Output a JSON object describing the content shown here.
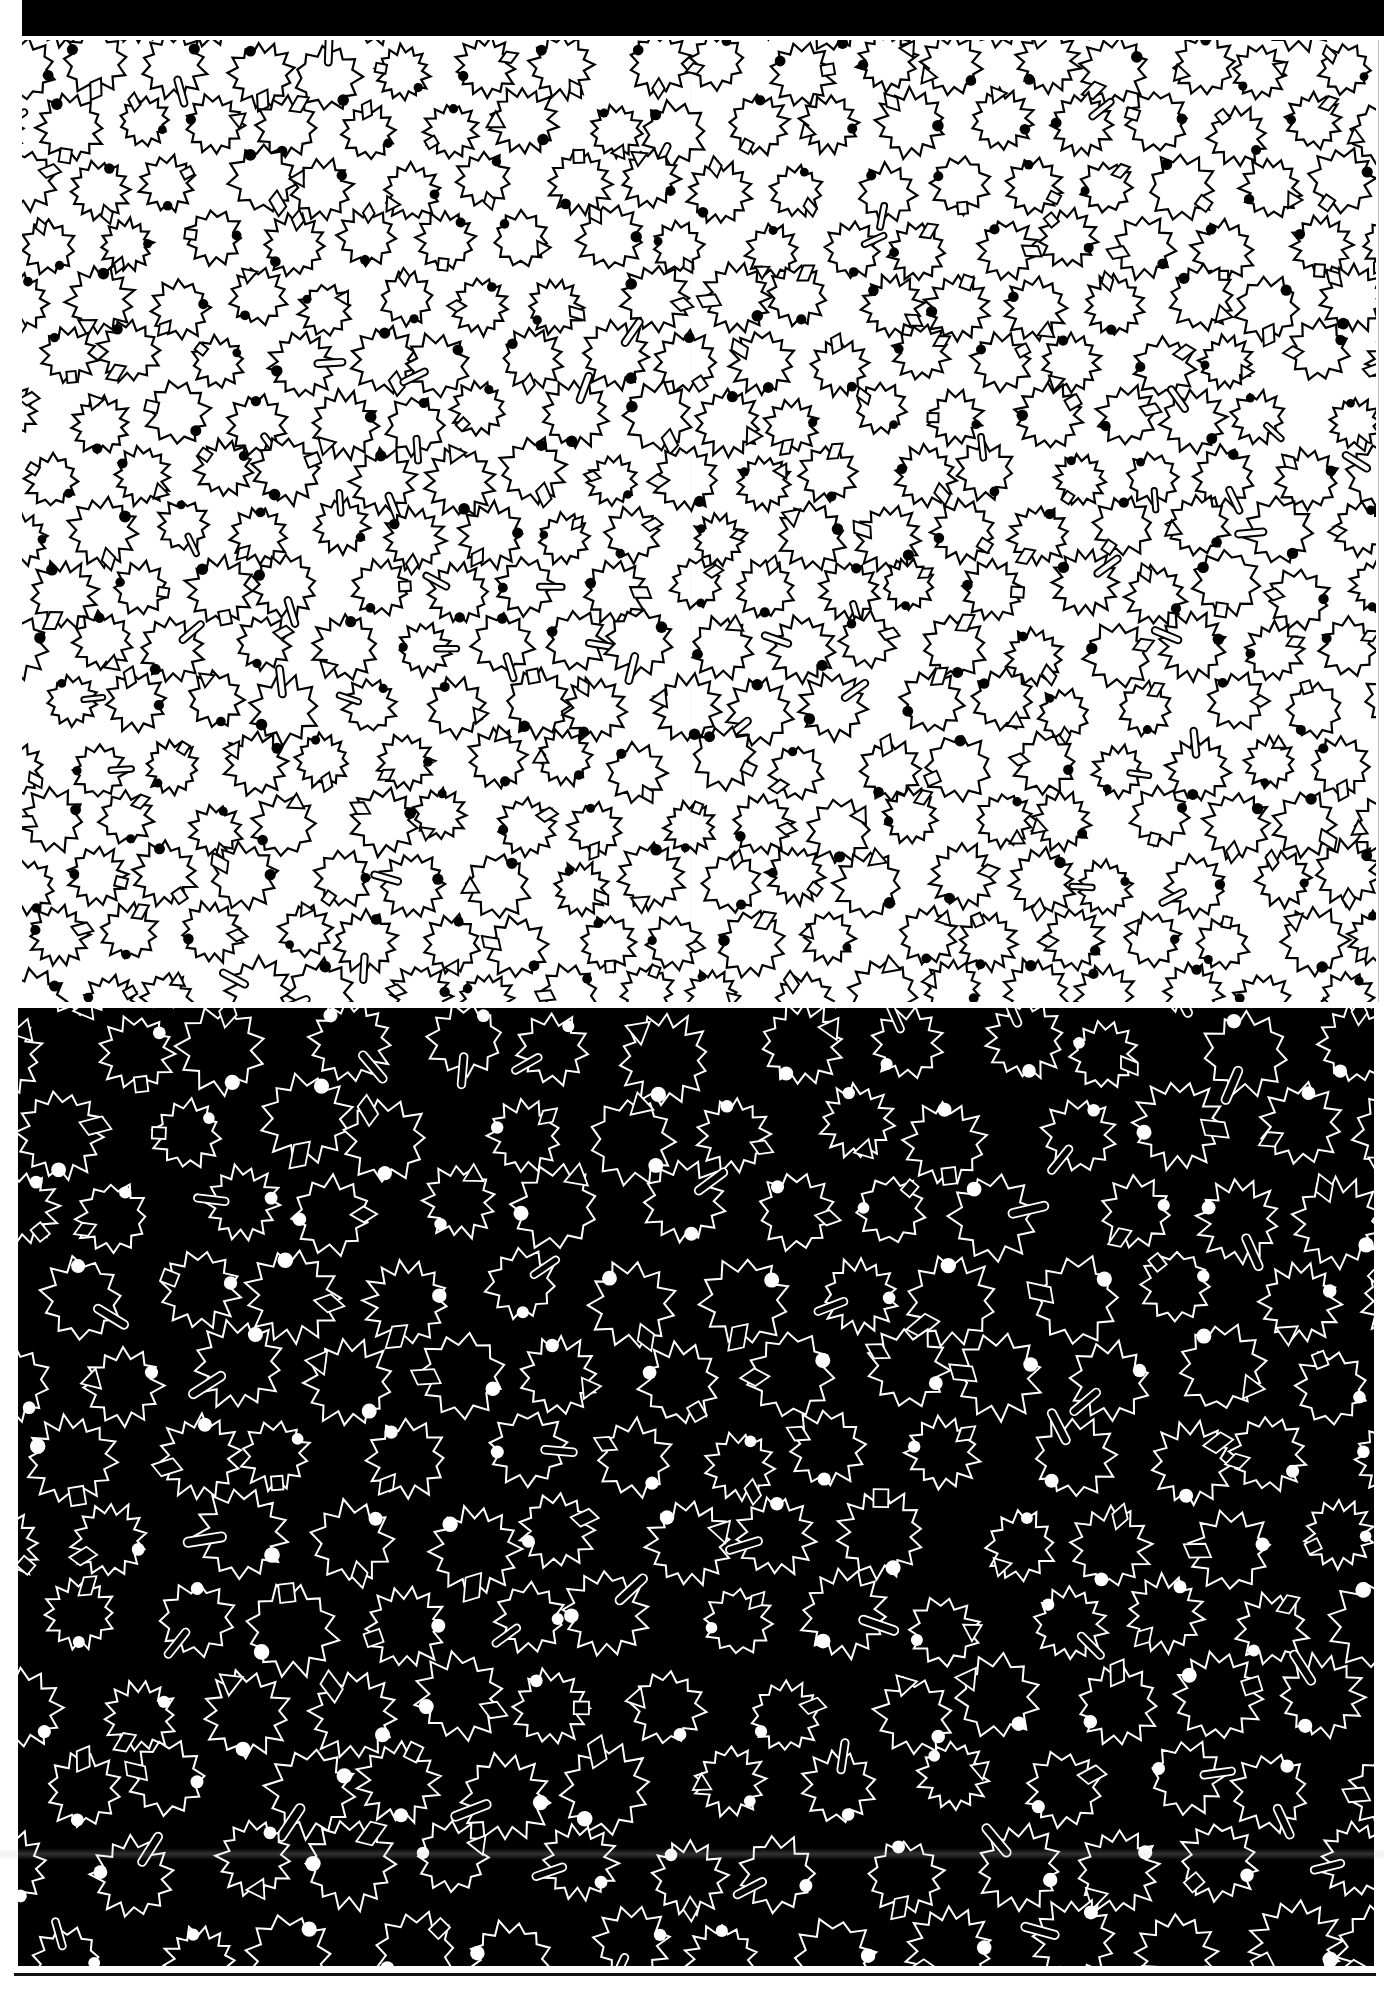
{
  "sheet": {
    "description": "Two-panel printed pattern sheet with star-leaf motifs",
    "colors": {
      "paper": "#ffffff",
      "ink": "#000000"
    }
  },
  "panels": [
    {
      "id": "light",
      "background": "#ffffff",
      "stroke": "#000000",
      "dot_fill": "#000000",
      "motif_radius": 30,
      "cell_w": 78,
      "cell_h": 58,
      "seed": 7
    },
    {
      "id": "dark",
      "background": "#000000",
      "stroke": "#ffffff",
      "dot_fill": "#ffffff",
      "motif_radius": 40,
      "cell_w": 110,
      "cell_h": 82,
      "seed": 19
    }
  ],
  "motif": {
    "type": "jagged-star-leaf",
    "points_min": 11,
    "points_max": 14,
    "accessories": [
      "dot",
      "bar",
      "diamond",
      "triangle",
      "square",
      "parallelogram"
    ]
  }
}
